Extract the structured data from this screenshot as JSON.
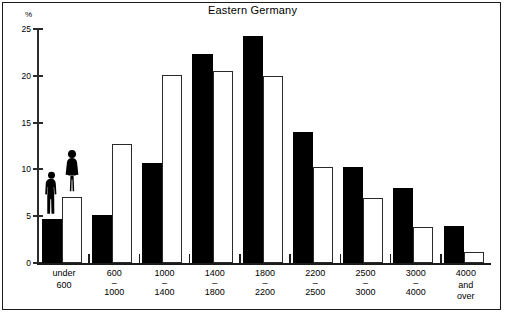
{
  "chart_data": {
    "type": "bar",
    "title": "Eastern Germany",
    "xlabel": "",
    "ylabel": "%",
    "ylim": [
      0,
      25
    ],
    "yticks": [
      0,
      5,
      10,
      15,
      20,
      25
    ],
    "ytick_labels": [
      "0",
      "5",
      "10",
      "15",
      "20",
      "25"
    ],
    "grid": false,
    "legend_position": "inline-figures-on-first-group",
    "categories": [
      "under 600",
      "600 - 1000",
      "1000 - 1400",
      "1400 - 1800",
      "1800 - 2200",
      "2200 - 2500",
      "2500 - 3000",
      "3000 - 4000",
      "4000 and over"
    ],
    "category_lines": [
      [
        "under",
        "",
        "600"
      ],
      [
        "600",
        "–",
        "1000"
      ],
      [
        "1000",
        "–",
        "1400"
      ],
      [
        "1400",
        "–",
        "1800"
      ],
      [
        "1800",
        "–",
        "2200"
      ],
      [
        "2200",
        "–",
        "2500"
      ],
      [
        "2500",
        "–",
        "3000"
      ],
      [
        "3000",
        "–",
        "4000"
      ],
      [
        "4000",
        "and",
        "over"
      ]
    ],
    "series": [
      {
        "name": "men",
        "icon": "male-figure-icon",
        "color": "#000000",
        "values": [
          4.7,
          5.1,
          10.7,
          22.3,
          24.3,
          14.0,
          10.3,
          8.0,
          4.0
        ]
      },
      {
        "name": "women",
        "icon": "female-figure-icon",
        "color": "#ffffff",
        "values": [
          7.0,
          12.7,
          20.1,
          20.5,
          20.0,
          10.3,
          6.9,
          3.8,
          1.2
        ]
      }
    ]
  },
  "axis": {
    "percent_symbol": "%"
  }
}
